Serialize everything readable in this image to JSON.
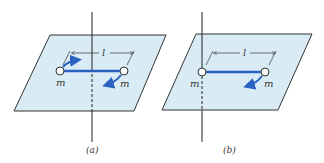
{
  "colors": {
    "plane_fill": "#d9ecf5",
    "plane_edge": "#333333",
    "rod": "#2a62c2",
    "arrow": "#2a62c2",
    "axis": "#222222",
    "mass_fill": "#ffffff"
  },
  "panels": [
    {
      "id": "a",
      "caption": "(a)",
      "mass_left_label": "m",
      "mass_right_label": "m",
      "length_label": "l",
      "axis_position": "center of rod"
    },
    {
      "id": "b",
      "caption": "(b)",
      "mass_left_label": "m",
      "mass_right_label": "m",
      "length_label": "l",
      "axis_position": "through left mass"
    }
  ]
}
